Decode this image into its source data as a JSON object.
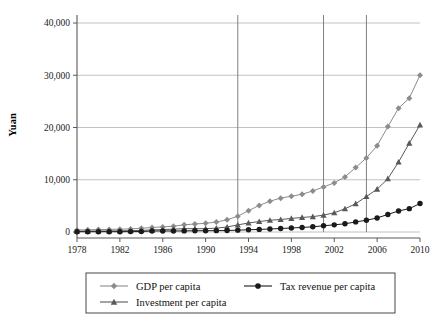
{
  "chart_data": {
    "type": "line",
    "title": "",
    "xlabel": "",
    "ylabel": "Yuan",
    "xlim": [
      1978,
      2010
    ],
    "ylim": [
      0,
      40000
    ],
    "grid": true,
    "legend_position": "bottom",
    "x": [
      1978,
      1979,
      1980,
      1981,
      1982,
      1983,
      1984,
      1985,
      1986,
      1987,
      1988,
      1989,
      1990,
      1991,
      1992,
      1993,
      1994,
      1995,
      1996,
      1997,
      1998,
      1999,
      2000,
      2001,
      2002,
      2003,
      2004,
      2005,
      2006,
      2007,
      2008,
      2009,
      2010
    ],
    "xticks": [
      1978,
      1982,
      1986,
      1990,
      1994,
      1998,
      2002,
      2006,
      2010
    ],
    "xtick_labels": [
      "1978",
      "1982",
      "1986",
      "1990",
      "1994",
      "1998",
      "2002",
      "2006",
      "2010"
    ],
    "yticks": [
      0,
      10000,
      20000,
      30000,
      40000
    ],
    "ytick_labels": [
      "0",
      "10,000",
      "20,000",
      "30,000",
      "40,000"
    ],
    "vertical_reference_lines": [
      1993,
      2001,
      2005
    ],
    "series": [
      {
        "name": "GDP per capita",
        "marker": "diamond",
        "color": "#8c8c8c",
        "values": [
          385,
          423,
          468,
          497,
          533,
          588,
          702,
          866,
          973,
          1112,
          1372,
          1537,
          1663,
          1912,
          2334,
          3027,
          4081,
          5091,
          5898,
          6481,
          6860,
          7229,
          7858,
          8622,
          9398,
          10542,
          12336,
          14185,
          16500,
          20169,
          23708,
          25608,
          30015
        ]
      },
      {
        "name": "Tax revenue per capita",
        "marker": "circle",
        "color": "#1a1a1a",
        "values": [
          55,
          56,
          58,
          60,
          61,
          74,
          92,
          193,
          198,
          198,
          209,
          237,
          249,
          257,
          275,
          358,
          424,
          497,
          568,
          673,
          763,
          869,
          1000,
          1190,
          1370,
          1570,
          1930,
          2250,
          2690,
          3360,
          4030,
          4470,
          5450
        ]
      },
      {
        "name": "Investment per capita",
        "marker": "triangle",
        "color": "#595959",
        "values": [
          158,
          175,
          198,
          196,
          226,
          252,
          310,
          400,
          470,
          540,
          640,
          630,
          640,
          730,
          960,
          1360,
          1730,
          2000,
          2250,
          2390,
          2600,
          2780,
          2940,
          3230,
          3680,
          4440,
          5420,
          6780,
          8200,
          10200,
          13400,
          17000,
          20500
        ]
      }
    ]
  },
  "legend": {
    "entries": [
      {
        "label": "GDP per capita"
      },
      {
        "label": "Tax revenue per capita"
      },
      {
        "label": "Investment per capita"
      }
    ]
  }
}
